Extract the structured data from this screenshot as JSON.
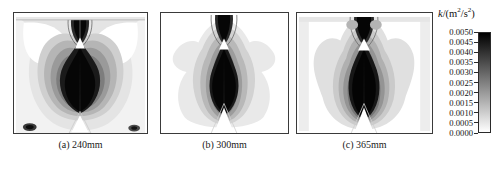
{
  "figure": {
    "type": "contour-plot-set",
    "panel_count": 3
  },
  "panels": [
    {
      "id": "a",
      "caption": "(a) 240mm",
      "description": "turbulent kinetic energy contour, symmetric twin-lobe heart shape, white upper side pockets, narrow white triangular notch at top center"
    },
    {
      "id": "b",
      "caption": "(b) 300mm",
      "description": "turbulent kinetic energy contour, narrower twin-lobe shape with white wedge notch at bottom center and flared upper shoulders"
    },
    {
      "id": "c",
      "caption": "(c) 365mm",
      "description": "turbulent kinetic energy contour, broad twin-lobe shape extending lower, tall central stem, white wedge at bottom center"
    }
  ],
  "colorbar": {
    "title_symbol": "k",
    "title_slash": "/(m",
    "title_sup1": "2",
    "title_mid": "/s",
    "title_sup2": "2",
    "title_close": ")",
    "orientation": "vertical",
    "colormap": "grayscale-reversed",
    "high_color": "#000000",
    "low_color": "#ffffff",
    "ticks": [
      "0.0050",
      "0.0045",
      "0.0040",
      "0.0035",
      "0.0030",
      "0.0025",
      "0.0020",
      "0.0015",
      "0.0010",
      "0.0005",
      "0.0000"
    ],
    "min": "0.0000",
    "max": "0.0050",
    "step": "0.0005"
  },
  "chart_data": {
    "type": "heatmap",
    "title": "k/(m2/s2)",
    "subtitle": "",
    "xlabel": "",
    "ylabel": "",
    "legend_position": "right",
    "grid": false,
    "colorbar_label": "k/(m^2/s^2)",
    "zlim": [
      0.0,
      0.005
    ],
    "z_tick_values": [
      0.005,
      0.0045,
      0.004,
      0.0035,
      0.003,
      0.0025,
      0.002,
      0.0015,
      0.001,
      0.0005,
      0.0
    ],
    "colormap": "gray_r",
    "panels": [
      {
        "label": "(a) 240mm",
        "station_mm": 240,
        "peak_k": 0.005,
        "min_k": 0.0,
        "notes": "Two symmetric high-k lobes merged into a broad heart-shaped core; low-k (white) pockets in the upper left and upper right corners; small white triangular void on the centerline near the top."
      },
      {
        "label": "(b) 300mm",
        "station_mm": 300,
        "peak_k": 0.005,
        "min_k": 0.0,
        "notes": "Narrower high-k core with a pronounced white wedge intruding from the bottom centerline; outer contours pinch inward at mid-height."
      },
      {
        "label": "(c) 365mm",
        "station_mm": 365,
        "peak_k": 0.005,
        "min_k": 0.0,
        "notes": "Widest, lowest-extending high-k lobes with a long vertical stem along the centerline and a white wedge at the bottom center."
      }
    ]
  }
}
